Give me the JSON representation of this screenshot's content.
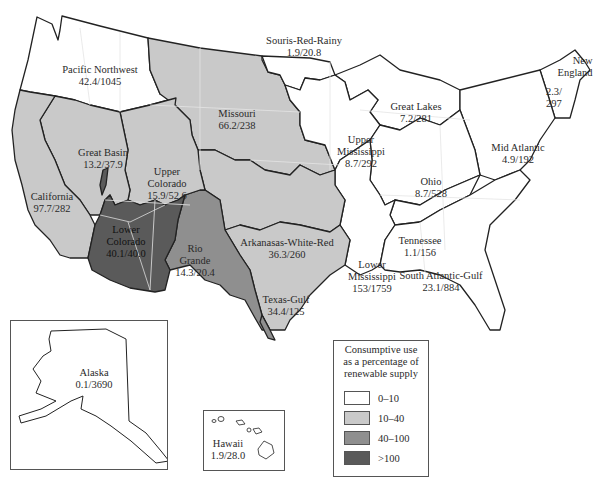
{
  "map": {
    "title": "Consumptive use as a percentage of renewable supply by water resource region",
    "legend": {
      "title_lines": [
        "Consumptive use",
        "as a percentage of",
        "renewable supply"
      ],
      "classes": [
        {
          "range": "0–10",
          "color": "#ffffff"
        },
        {
          "range": "10–40",
          "color": "#c9c9c9"
        },
        {
          "range": "40–100",
          "color": "#8f8f8f"
        },
        {
          "range": ">100",
          "color": "#5a5a5a"
        }
      ]
    },
    "regions": [
      {
        "name": "Pacific Northwest",
        "value": "42.4/1045",
        "class": "0–10"
      },
      {
        "name": "Souris-Red-Rainy",
        "value": "1.9/20.8",
        "class": "0–10"
      },
      {
        "name": "Missouri",
        "value": "66.2/238",
        "class": "10–40"
      },
      {
        "name": "Great Lakes",
        "value": "7.2/281",
        "class": "0–10"
      },
      {
        "name": "New England",
        "value": "2.3/297",
        "class": "0–10"
      },
      {
        "name": "Great Basin",
        "value": "13.2/37.9",
        "class": "10–40"
      },
      {
        "name": "Upper Colorado",
        "value": "15.9/52.6",
        "class": "10–40"
      },
      {
        "name": "Upper Mississippi",
        "value": "8.7/292",
        "class": "0–10"
      },
      {
        "name": "Mid Atlantic",
        "value": "4.9/192",
        "class": "0–10"
      },
      {
        "name": "California",
        "value": "97.7/282",
        "class": "10–40"
      },
      {
        "name": "Ohio",
        "value": "8.7/528",
        "class": "0–10"
      },
      {
        "name": "Lower Colorado",
        "value": "40.1/40.0",
        "class": ">100"
      },
      {
        "name": "Rio Grande",
        "value": "14.3/20.4",
        "class": "40–100"
      },
      {
        "name": "Arkanasas-White-Red",
        "value": "36.3/260",
        "class": "10–40"
      },
      {
        "name": "Tennessee",
        "value": "1.1/156",
        "class": "0–10"
      },
      {
        "name": "Lower Mississippi",
        "value": "153/1759",
        "class": "0–10"
      },
      {
        "name": "South Atlantic-Gulf",
        "value": "23.1/884",
        "class": "0–10"
      },
      {
        "name": "Texas-Gulf",
        "value": "34.4/125",
        "class": "10–40"
      },
      {
        "name": "Alaska",
        "value": "0.1/3690",
        "class": "0–10"
      },
      {
        "name": "Hawaii",
        "value": "1.9/28.0",
        "class": "0–10"
      }
    ]
  },
  "labels": {
    "pnw": [
      "Pacific Northwest",
      "42.4/1045"
    ],
    "srr": [
      "Souris-Red-Rainy",
      "1.9/20.8"
    ],
    "missouri": [
      "Missouri",
      "66.2/238"
    ],
    "greatlakes": [
      "Great Lakes",
      "7.2/281"
    ],
    "newengland": [
      "New",
      "England",
      "2.3/",
      "297"
    ],
    "greatbasin": [
      "Great Basin",
      "13.2/37.9"
    ],
    "uppercolorado": [
      "Upper",
      "Colorado",
      "15.9/52.6"
    ],
    "uppermiss": [
      "Upper",
      "Mississippi",
      "8.7/292"
    ],
    "midatlantic": [
      "Mid Atlantic",
      "4.9/192"
    ],
    "california": [
      "California",
      "97.7/282"
    ],
    "ohio": [
      "Ohio",
      "8.7/528"
    ],
    "lowercolorado": [
      "Lower",
      "Colorado",
      "40.1/40.0"
    ],
    "riogrande": [
      "Rio",
      "Grande",
      "14.3/20.4"
    ],
    "awr": [
      "Arkanasas-White-Red",
      "36.3/260"
    ],
    "tennessee": [
      "Tennessee",
      "1.1/156"
    ],
    "lowermiss": [
      "Lower",
      "Mississippi",
      "153/1759"
    ],
    "sag": [
      "South Atlantic-Gulf",
      "23.1/884"
    ],
    "texasgulf": [
      "Texas-Gulf",
      "34.4/125"
    ],
    "alaska": [
      "Alaska",
      "0.1/3690"
    ],
    "hawaii": [
      "Hawaii",
      "1.9/28.0"
    ]
  },
  "colors": {
    "low": "#ffffff",
    "mid": "#c9c9c9",
    "high": "#8f8f8f",
    "veryhigh": "#5a5a5a",
    "border": "#222222",
    "state_line": "#e4e4e4"
  }
}
